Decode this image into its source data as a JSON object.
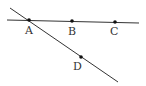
{
  "diagram": {
    "type": "geometry",
    "lines": [
      {
        "name": "line-abc",
        "from": [
          7,
          20
        ],
        "to": [
          139,
          23
        ]
      },
      {
        "name": "line-ad",
        "from": [
          10,
          8
        ],
        "to": [
          118,
          82
        ]
      }
    ],
    "points": [
      {
        "id": "A",
        "label": "A",
        "x": 29,
        "y": 20,
        "lx": 25,
        "ly": 34
      },
      {
        "id": "B",
        "label": "B",
        "x": 72,
        "y": 21,
        "lx": 68,
        "ly": 35
      },
      {
        "id": "C",
        "label": "C",
        "x": 115,
        "y": 22,
        "lx": 110,
        "ly": 35
      },
      {
        "id": "D",
        "label": "D",
        "x": 81,
        "y": 57,
        "lx": 73,
        "ly": 70
      }
    ],
    "colors": {
      "stroke": "#333333",
      "point": "#111111",
      "label": "#333333"
    }
  }
}
